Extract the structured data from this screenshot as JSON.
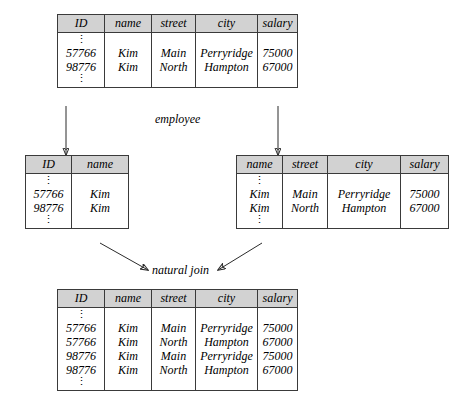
{
  "diagram": {
    "labels": {
      "source_relation": "employee",
      "operation": "natural join"
    },
    "ellipsis": "⋮"
  },
  "tables": {
    "employee": {
      "name": "employee",
      "columns": [
        "ID",
        "name",
        "street",
        "city",
        "salary"
      ],
      "rows": [
        [
          "57766",
          "Kim",
          "Main",
          "Perryridge",
          "75000"
        ],
        [
          "98776",
          "Kim",
          "North",
          "Hampton",
          "67000"
        ]
      ]
    },
    "projection_left": {
      "name": "",
      "columns": [
        "ID",
        "name"
      ],
      "rows": [
        [
          "57766",
          "Kim"
        ],
        [
          "98776",
          "Kim"
        ]
      ]
    },
    "projection_right": {
      "name": "",
      "columns": [
        "name",
        "street",
        "city",
        "salary"
      ],
      "rows": [
        [
          "Kim",
          "Main",
          "Perryridge",
          "75000"
        ],
        [
          "Kim",
          "North",
          "Hampton",
          "67000"
        ]
      ]
    },
    "join_result": {
      "name": "",
      "columns": [
        "ID",
        "name",
        "street",
        "city",
        "salary"
      ],
      "rows": [
        [
          "57766",
          "Kim",
          "Main",
          "Perryridge",
          "75000"
        ],
        [
          "57766",
          "Kim",
          "North",
          "Hampton",
          "67000"
        ],
        [
          "98776",
          "Kim",
          "Main",
          "Perryridge",
          "75000"
        ],
        [
          "98776",
          "Kim",
          "North",
          "Hampton",
          "67000"
        ]
      ]
    }
  },
  "colors": {
    "header_fill": "#d2d2d2",
    "border": "#3a3a3a",
    "background": "#ffffff",
    "text": "#000000"
  }
}
